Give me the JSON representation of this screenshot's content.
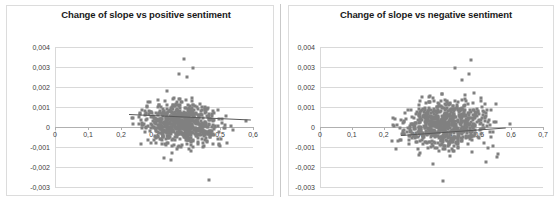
{
  "figure": {
    "background_color": "#ffffff",
    "border_color": "#dcdcdc",
    "divider_color": "#c9c9c9",
    "panel_count": 2
  },
  "chart_data": [
    {
      "type": "scatter",
      "title": "Change of slope vs positive sentiment",
      "xlabel": "",
      "ylabel": "",
      "xlim": [
        0,
        0.6
      ],
      "ylim": [
        -0.003,
        0.004
      ],
      "xticks": [
        0,
        0.1,
        0.2,
        0.3,
        0.4,
        0.5,
        0.6
      ],
      "xticklabels": [
        "0",
        "0,1",
        "0,2",
        "0,3",
        "0,4",
        "0,5",
        "0,6"
      ],
      "yticks": [
        0.004,
        0.003,
        0.002,
        0.001,
        0,
        -0.001,
        -0.002,
        -0.003
      ],
      "yticklabels": [
        "0,004",
        "0,003",
        "0,002",
        "0,001",
        "0",
        "-0,001",
        "-0,002",
        "-0,003"
      ],
      "grid": true,
      "grid_axis": "y",
      "legend": false,
      "marker_color": "#808080",
      "marker_shape": "diamond",
      "trendline": {
        "visible": true,
        "color": "#595959",
        "slope": -0.00075,
        "intercept": 0.00055,
        "x_start": 0.225,
        "x_end": 0.595,
        "direction": "negative"
      },
      "cluster": {
        "x_center": 0.385,
        "y_center": 0.00015,
        "x_spread": 0.058,
        "y_spread": 0.00055,
        "n_points": 760
      },
      "notable_outliers": [
        {
          "x": 0.392,
          "y": 0.0034
        },
        {
          "x": 0.419,
          "y": 0.00295
        },
        {
          "x": 0.375,
          "y": 0.00265
        },
        {
          "x": 0.399,
          "y": 0.00248
        },
        {
          "x": 0.339,
          "y": 0.00182
        },
        {
          "x": 0.327,
          "y": 0.00067
        },
        {
          "x": 0.467,
          "y": -0.00265
        },
        {
          "x": 0.329,
          "y": -0.00155
        },
        {
          "x": 0.352,
          "y": -0.00166
        },
        {
          "x": 0.578,
          "y": 0.00032
        }
      ]
    },
    {
      "type": "scatter",
      "title": "Change of slope vs negative sentiment",
      "xlabel": "",
      "ylabel": "",
      "xlim": [
        0,
        0.7
      ],
      "ylim": [
        -0.003,
        0.004
      ],
      "xticks": [
        0,
        0.1,
        0.2,
        0.3,
        0.4,
        0.5,
        0.6,
        0.7
      ],
      "xticklabels": [
        "0",
        "0,1",
        "0,2",
        "0,3",
        "0,4",
        "0,5",
        "0,6",
        "0,7"
      ],
      "yticks": [
        0.004,
        0.003,
        0.002,
        0.001,
        0,
        -0.001,
        -0.002,
        -0.003
      ],
      "yticklabels": [
        "0,004",
        "0,003",
        "0,002",
        "0,001",
        "0",
        "-0,001",
        "-0,002",
        "-0,003"
      ],
      "grid": true,
      "grid_axis": "y",
      "legend": false,
      "marker_color": "#808080",
      "marker_shape": "diamond",
      "trendline": {
        "visible": true,
        "color": "#595959",
        "slope": 0.00115,
        "intercept": -0.00024,
        "x_start": 0.255,
        "x_end": 0.585,
        "direction": "positive"
      },
      "cluster": {
        "x_center": 0.392,
        "y_center": 0.00012,
        "x_spread": 0.062,
        "y_spread": 0.00058,
        "n_points": 760
      },
      "notable_outliers": [
        {
          "x": 0.474,
          "y": 0.00335
        },
        {
          "x": 0.425,
          "y": 0.00293
        },
        {
          "x": 0.468,
          "y": 0.00266
        },
        {
          "x": 0.447,
          "y": 0.00236
        },
        {
          "x": 0.386,
          "y": -0.00268
        },
        {
          "x": 0.356,
          "y": -0.00185
        },
        {
          "x": 0.522,
          "y": -0.00174
        },
        {
          "x": 0.556,
          "y": -0.00152
        },
        {
          "x": 0.559,
          "y": -0.00135
        },
        {
          "x": 0.595,
          "y": 0.00013
        }
      ]
    }
  ]
}
